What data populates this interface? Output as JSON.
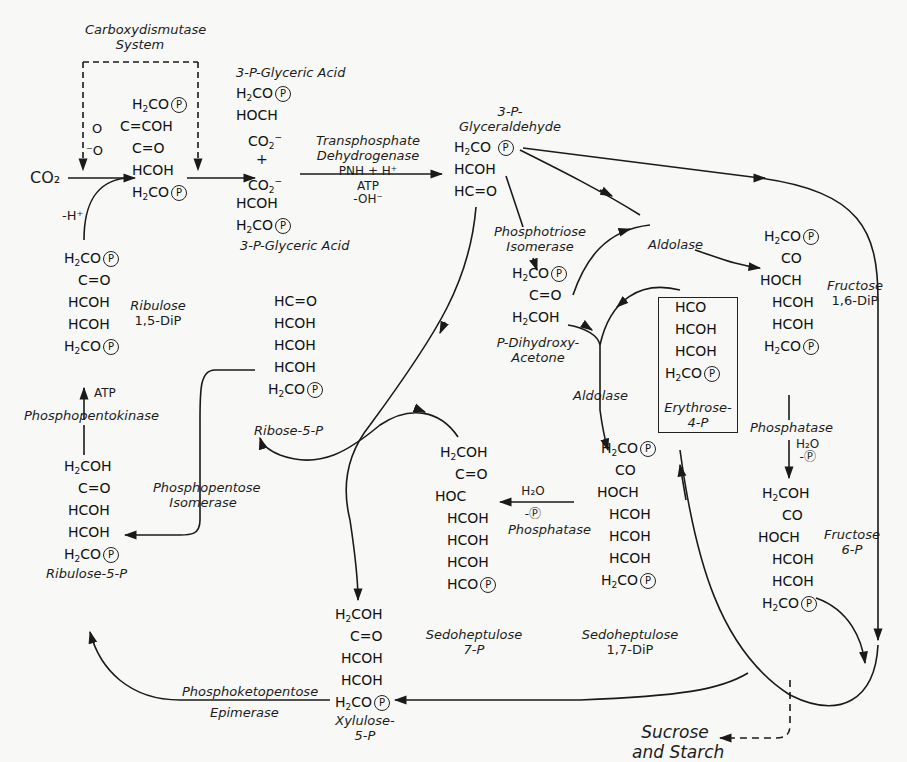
{
  "enzymes": {
    "carboxydismutase": "Carboxydismutase",
    "carboxydismutase_2": "System",
    "transphosphate": "Transphosphate",
    "transphosphate_2": "Dehydrogenase",
    "transphosphate_cofactor_1": "PNH + H⁺",
    "transphosphate_cofactor_2": "ATP",
    "transphosphate_cofactor_3": "-OH⁻",
    "phosphotriose": "Phosphotriose",
    "phosphotriose_2": "Isomerase",
    "aldolase_1": "Aldolase",
    "aldolase_2": "Aldolase",
    "phosphatase_1": "Phosphatase",
    "phosphatase_1_h2o": "H₂O",
    "phosphatase_1_p": "-Ⓟ",
    "phosphatase_2": "Phosphatase",
    "phosphatase_2_h2o": "H₂O",
    "phosphatase_2_p": "-Ⓟ",
    "phosphopentokinase": "Phosphopentokinase",
    "phosphopentokinase_atp": "ATP",
    "phosphopentose_isomerase": "Phosphopentose",
    "phosphopentose_isomerase_2": "Isomerase",
    "phosphoketopentose_epimerase": "Phosphoketopentose",
    "phosphoketopentose_epimerase_2": "Epimerase"
  },
  "misc": {
    "co2": "CO₂",
    "minus_h": "-H⁺",
    "plus": "+",
    "sucrose": "Sucrose",
    "starch": "and Starch"
  },
  "compounds": {
    "pga_top": {
      "name": "3-P-Glyceric Acid",
      "rows": [
        "H₂CO|P",
        "HOCH",
        "CO₂⁻"
      ]
    },
    "pga_bottom": {
      "name": "3-P-Glyceric Acid",
      "rows": [
        "CO₂⁻",
        "HCOH",
        "H₂CO|P"
      ]
    },
    "intermediate": {
      "rows": [
        "H₂CO|P",
        "C=COH",
        "C=O",
        "HCOH",
        "H₂CO|P"
      ]
    },
    "glyceraldehyde": {
      "name_1": "3-P-",
      "name_2": "Glyceraldehyde",
      "rows": [
        "H₂CO|P",
        "HCOH",
        "HC=O"
      ]
    },
    "dihydroxyacetone": {
      "name_1": "P-Dihydroxy-",
      "name_2": "Acetone",
      "rows": [
        "H₂CO|P",
        "C=O",
        "H₂COH"
      ]
    },
    "fructose_16": {
      "name_1": "Fructose",
      "name_2": "1,6-DiP",
      "rows": [
        "H₂CO|P",
        "CO",
        "HOCH",
        "HCOH",
        "HCOH",
        "H₂CO|P"
      ]
    },
    "erythrose": {
      "name_1": "Erythrose-",
      "name_2": "4-P",
      "rows": [
        "HCO",
        "HCOH",
        "HCOH",
        "H₂CO|P"
      ]
    },
    "fructose_6": {
      "name_1": "Fructose",
      "name_2": "6-P",
      "rows": [
        "H₂COH",
        "CO",
        "HOCH",
        "HCOH",
        "HCOH",
        "H₂CO|P"
      ]
    },
    "ribulose_15": {
      "name_1": "Ribulose",
      "name_2": "1,5-DiP",
      "rows": [
        "H₂CO|P",
        "C=O",
        "HCOH",
        "HCOH",
        "H₂CO|P"
      ]
    },
    "ribose_5p": {
      "name": "Ribose-5-P",
      "rows": [
        "HC=O",
        "HCOH",
        "HCOH",
        "HCOH",
        "H₂CO|P"
      ]
    },
    "ribulose_5p": {
      "name": "Ribulose-5-P",
      "rows": [
        "H₂COH",
        "C=O",
        "HCOH",
        "HCOH",
        "H₂CO|P"
      ]
    },
    "sedoheptulose_7p": {
      "name_1": "Sedoheptulose",
      "name_2": "7-P",
      "rows": [
        "H₂COH",
        "C=O",
        "HOC",
        "HCOH",
        "HCOH",
        "HCOH",
        "HCO|P"
      ]
    },
    "sedoheptulose_17": {
      "name_1": "Sedoheptulose",
      "name_2": "1,7-DiP",
      "rows": [
        "H₂CO|P",
        "CO",
        "HOCH",
        "HCOH",
        "HCOH",
        "HCOH",
        "H₂CO|P"
      ]
    },
    "xylulose_5p": {
      "name_1": "Xylulose-",
      "name_2": "5-P",
      "rows": [
        "H₂COH",
        "C=O",
        "HCOH",
        "HCOH",
        "H₂CO|P"
      ]
    }
  },
  "colors": {
    "ink": "#1a1a1a",
    "paper": "#f8f8f6"
  }
}
